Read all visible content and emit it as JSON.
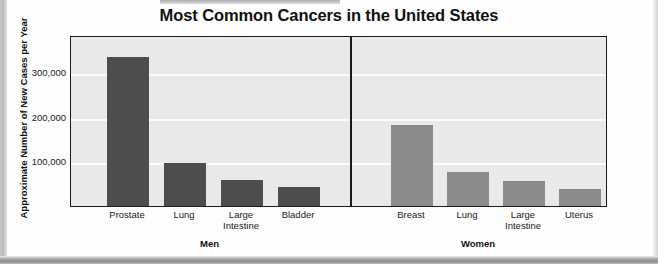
{
  "chart_data": {
    "type": "bar",
    "title": "Most Common Cancers in the United States",
    "xlabel": "",
    "ylabel": "Approximate Number of New Cases per Year",
    "ylim": [
      0,
      384000
    ],
    "ytick_labels": [
      "300,000",
      "200,000",
      "100,000"
    ],
    "ytick_values": [
      300000,
      200000,
      100000
    ],
    "grid": true,
    "gridline_color": "#fbfbfb",
    "plot_background": "#e9e9e9",
    "legend": "none",
    "groups": [
      {
        "name": "Men",
        "color": "#4d4d4d",
        "categories": [
          "Prostate",
          "Lung",
          "Large Intestine",
          "Bladder"
        ],
        "values": [
          334000,
          96000,
          58000,
          43000
        ]
      },
      {
        "name": "Women",
        "color": "#8b8b8b",
        "categories": [
          "Breast",
          "Lung",
          "Large Intestine",
          "Uterus"
        ],
        "values": [
          182000,
          76000,
          56000,
          38000
        ]
      }
    ],
    "categories": [
      "Prostate",
      "Lung",
      "Large Intestine",
      "Bladder",
      "Breast",
      "Lung",
      "Large Intestine",
      "Uterus"
    ],
    "values": [
      334000,
      96000,
      58000,
      43000,
      182000,
      76000,
      56000,
      38000
    ]
  },
  "bars": [
    {
      "label_line1": "Prostate",
      "label_line2": "",
      "group": "men"
    },
    {
      "label_line1": "Lung",
      "label_line2": "",
      "group": "men"
    },
    {
      "label_line1": "Large",
      "label_line2": "Intestine",
      "group": "men"
    },
    {
      "label_line1": "Bladder",
      "label_line2": "",
      "group": "men"
    },
    {
      "label_line1": "Breast",
      "label_line2": "",
      "group": "women"
    },
    {
      "label_line1": "Lung",
      "label_line2": "",
      "group": "women"
    },
    {
      "label_line1": "Large",
      "label_line2": "Intestine",
      "group": "women"
    },
    {
      "label_line1": "Uterus",
      "label_line2": "",
      "group": "women"
    }
  ],
  "group_labels": [
    "Men",
    "Women"
  ],
  "colors": {
    "men_bar": "#4d4d4d",
    "women_bar": "#8b8b8b",
    "axis": "#1a1a1a",
    "plot_bg": "#e9e9e9",
    "page_bg": "#fdfdfd"
  }
}
